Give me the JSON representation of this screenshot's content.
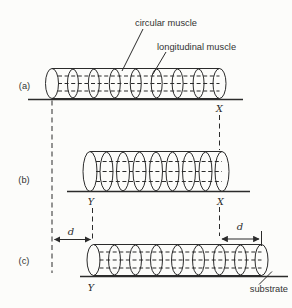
{
  "diagram": {
    "title_semantics": "worm peristalsis muscle diagram",
    "annotations": {
      "circular_muscle": "circular muscle",
      "longitudinal_muscle": "longitudinal muscle",
      "substrate": "substrate"
    },
    "rows": [
      {
        "label": "(a)"
      },
      {
        "label": "(b)"
      },
      {
        "label": "(c)"
      }
    ],
    "markers": {
      "x": "X",
      "y": "Y",
      "distance": "d"
    },
    "colors": {
      "ink": "#2b2b2b",
      "text": "#333333",
      "background": "#fcfcfa"
    }
  }
}
